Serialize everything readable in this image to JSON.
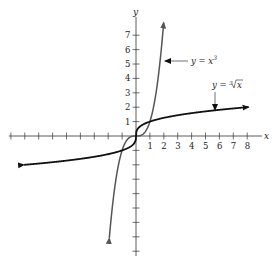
{
  "chart_data": {
    "type": "line",
    "title": "",
    "xlabel": "x",
    "ylabel": "y",
    "xlim": [
      -9,
      9
    ],
    "ylim": [
      -8,
      8.5
    ],
    "grid": false,
    "x_tick_labels": [
      "1",
      "2",
      "3",
      "4",
      "5",
      "6",
      "7",
      "8"
    ],
    "y_tick_labels": [
      "1",
      "2",
      "3",
      "4",
      "5",
      "6",
      "7"
    ],
    "series": [
      {
        "name": "y = x³",
        "color": "#555555",
        "function": "x^3",
        "x": [
          -2,
          -1.5,
          -1,
          -0.5,
          0,
          0.5,
          1,
          1.5,
          1.95
        ],
        "y": [
          -8,
          -3.375,
          -1,
          -0.125,
          0,
          0.125,
          1,
          3.375,
          7.4
        ]
      },
      {
        "name": "y = ∛x",
        "color": "#111111",
        "function": "cbrt(x)",
        "x": [
          -8,
          -4,
          -1,
          -0.125,
          0,
          0.125,
          1,
          4,
          8
        ],
        "y": [
          -2,
          -1.587,
          -1,
          -0.5,
          0,
          0.5,
          1,
          1.587,
          2
        ]
      }
    ],
    "annotations": [
      {
        "text": "y = x³",
        "points_to": "x^3 curve near y=5"
      },
      {
        "text": "y = ∛x",
        "points_to": "cube-root curve near x=5.5"
      }
    ]
  },
  "labels": {
    "x_axis": "x",
    "y_axis": "y",
    "eq_cube": "y = x",
    "eq_cube_exp": "3",
    "eq_root_prefix": "y = ",
    "eq_root_index": "3",
    "eq_root_arg": "x"
  }
}
